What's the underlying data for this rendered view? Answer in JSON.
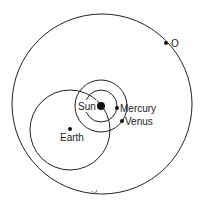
{
  "diagram": {
    "type": "orbital-diagram",
    "outer_circle": {
      "cx": 102,
      "cy": 104,
      "r": 90
    },
    "earth_circle": {
      "cx": 70,
      "cy": 130,
      "r": 40
    },
    "sun_circles": [
      {
        "cx": 101,
        "cy": 106,
        "r": 16
      },
      {
        "cx": 101,
        "cy": 106,
        "r": 26
      }
    ],
    "bodies": [
      {
        "id": "sun",
        "label": "Sun",
        "x": 101,
        "y": 106,
        "r": 4
      },
      {
        "id": "mercury",
        "label": "Mercury",
        "x": 117,
        "y": 108,
        "r": 2
      },
      {
        "id": "venus",
        "label": "Venus",
        "x": 122,
        "y": 121,
        "r": 2
      },
      {
        "id": "earth",
        "label": "Earth",
        "x": 70,
        "y": 129,
        "r": 2
      },
      {
        "id": "o",
        "label": "O",
        "x": 166,
        "y": 43,
        "r": 2
      }
    ],
    "colors": {
      "stroke": "#222222",
      "background": "#ffffff"
    }
  }
}
